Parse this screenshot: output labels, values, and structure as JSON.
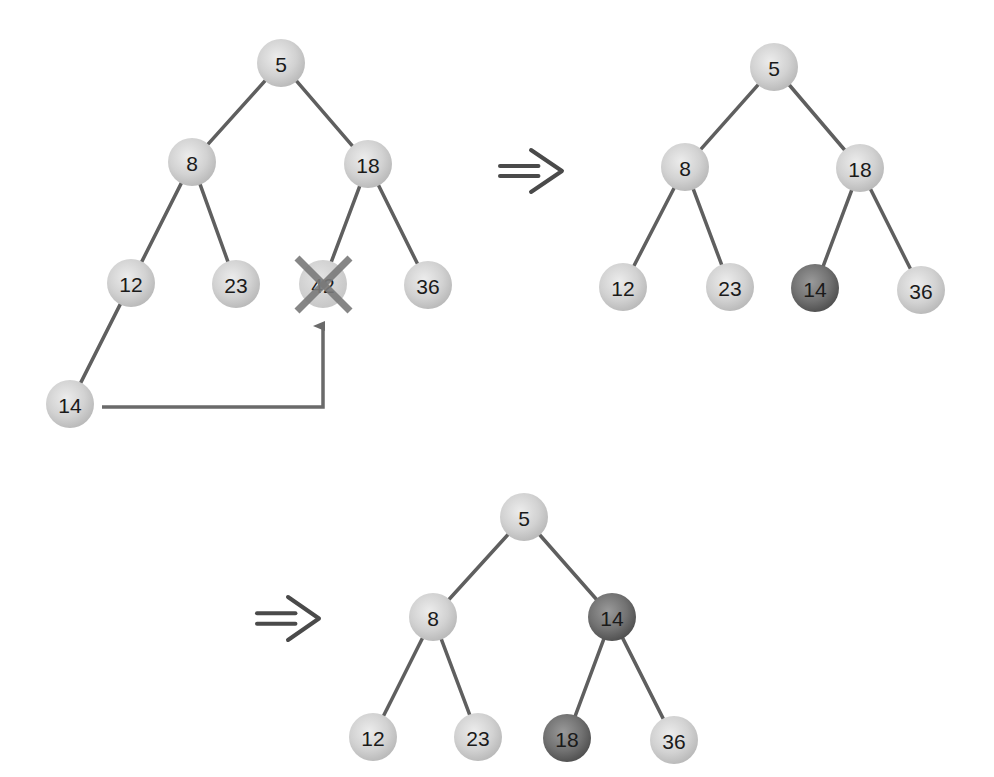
{
  "diagram": {
    "title": "",
    "colors": {
      "edge": "#5f5f5f",
      "node_light": "#d4d4d4",
      "node_dark": "#6e6e6e",
      "cross": "#7a7a7a",
      "arrow": "#4a4a4a"
    },
    "trees": [
      {
        "id": "step-1",
        "description": "Delete 42: last node 14 moves into its position",
        "nodes": [
          {
            "id": "t1n5",
            "label": "5",
            "x": 281,
            "y": 63,
            "style": "light"
          },
          {
            "id": "t1n8",
            "label": "8",
            "x": 192,
            "y": 162,
            "style": "light"
          },
          {
            "id": "t1n18",
            "label": "18",
            "x": 368,
            "y": 164,
            "style": "light"
          },
          {
            "id": "t1n12",
            "label": "12",
            "x": 131,
            "y": 283,
            "style": "light"
          },
          {
            "id": "t1n23",
            "label": "23",
            "x": 236,
            "y": 284,
            "style": "light"
          },
          {
            "id": "t1n42",
            "label": "42",
            "x": 323,
            "y": 284,
            "style": "deleted"
          },
          {
            "id": "t1n36",
            "label": "36",
            "x": 428,
            "y": 285,
            "style": "light"
          },
          {
            "id": "t1n14",
            "label": "14",
            "x": 70,
            "y": 404,
            "style": "light"
          }
        ],
        "edges": [
          [
            "t1n5",
            "t1n8"
          ],
          [
            "t1n5",
            "t1n18"
          ],
          [
            "t1n8",
            "t1n12"
          ],
          [
            "t1n8",
            "t1n23"
          ],
          [
            "t1n18",
            "t1n42"
          ],
          [
            "t1n18",
            "t1n36"
          ],
          [
            "t1n12",
            "t1n14"
          ]
        ],
        "move_arrow": {
          "from": "14",
          "to": "42"
        }
      },
      {
        "id": "step-2",
        "description": "14 placed in position of 42",
        "nodes": [
          {
            "id": "t2n5",
            "label": "5",
            "x": 774,
            "y": 67,
            "style": "light"
          },
          {
            "id": "t2n8",
            "label": "8",
            "x": 685,
            "y": 167,
            "style": "light"
          },
          {
            "id": "t2n18",
            "label": "18",
            "x": 860,
            "y": 168,
            "style": "light"
          },
          {
            "id": "t2n12",
            "label": "12",
            "x": 623,
            "y": 287,
            "style": "light"
          },
          {
            "id": "t2n23",
            "label": "23",
            "x": 730,
            "y": 287,
            "style": "light"
          },
          {
            "id": "t2n14",
            "label": "14",
            "x": 815,
            "y": 288,
            "style": "dark"
          },
          {
            "id": "t2n36",
            "label": "36",
            "x": 921,
            "y": 290,
            "style": "light"
          }
        ],
        "edges": [
          [
            "t2n5",
            "t2n8"
          ],
          [
            "t2n5",
            "t2n18"
          ],
          [
            "t2n8",
            "t2n12"
          ],
          [
            "t2n8",
            "t2n23"
          ],
          [
            "t2n18",
            "t2n14"
          ],
          [
            "t2n18",
            "t2n36"
          ]
        ]
      },
      {
        "id": "step-3",
        "description": "14 sifted up, swapped with 18",
        "nodes": [
          {
            "id": "t3n5",
            "label": "5",
            "x": 524,
            "y": 517,
            "style": "light"
          },
          {
            "id": "t3n8",
            "label": "8",
            "x": 433,
            "y": 617,
            "style": "light"
          },
          {
            "id": "t3n14",
            "label": "14",
            "x": 612,
            "y": 617,
            "style": "dark"
          },
          {
            "id": "t3n12",
            "label": "12",
            "x": 373,
            "y": 737,
            "style": "light"
          },
          {
            "id": "t3n23",
            "label": "23",
            "x": 478,
            "y": 737,
            "style": "light"
          },
          {
            "id": "t3n18",
            "label": "18",
            "x": 567,
            "y": 738,
            "style": "dark"
          },
          {
            "id": "t3n36",
            "label": "36",
            "x": 674,
            "y": 740,
            "style": "light"
          }
        ],
        "edges": [
          [
            "t3n5",
            "t3n8"
          ],
          [
            "t3n5",
            "t3n14"
          ],
          [
            "t3n8",
            "t3n12"
          ],
          [
            "t3n8",
            "t3n23"
          ],
          [
            "t3n14",
            "t3n18"
          ],
          [
            "t3n14",
            "t3n36"
          ]
        ]
      }
    ],
    "implies_arrows": [
      {
        "id": "implies-1",
        "glyph": "⟹",
        "x": 500,
        "y": 150,
        "w": 62,
        "h": 42
      },
      {
        "id": "implies-2",
        "glyph": "⟹",
        "x": 257,
        "y": 597,
        "w": 62,
        "h": 43
      }
    ]
  }
}
